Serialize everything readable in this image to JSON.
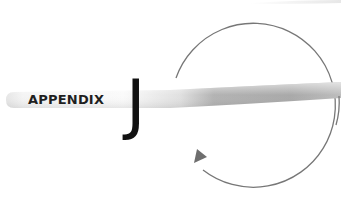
{
  "heading": {
    "label": "APPENDIX",
    "letter": "J"
  },
  "colors": {
    "background": "#ffffff",
    "band_light": "#f2f2f2",
    "band_dark": "#a8a8a8",
    "arc": "#777777",
    "arrowhead": "#6e6e6e",
    "text": "#1f1f1f"
  }
}
